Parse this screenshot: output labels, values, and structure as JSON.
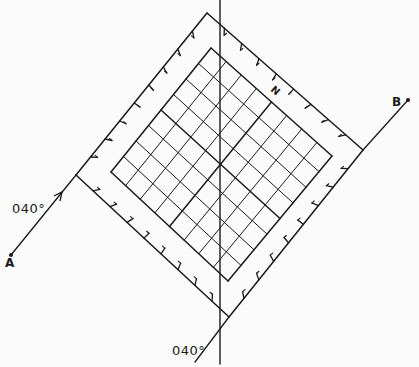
{
  "diagram": {
    "type": "grid-square-plan",
    "labels": {
      "point_a": "A",
      "point_b": "B",
      "bearing_left": "040°",
      "bearing_bottom": "040°",
      "north": "N"
    },
    "grid": {
      "cells_per_side": 8
    },
    "outer_square": {
      "top": [
        207,
        13
      ],
      "right": [
        363,
        150
      ],
      "bottom": [
        229,
        317
      ],
      "left": [
        76,
        175
      ]
    },
    "inner_square": {
      "top": [
        211,
        48
      ],
      "right": [
        332,
        156
      ],
      "bottom": [
        228,
        281
      ],
      "left": [
        111,
        172
      ]
    },
    "colors": {
      "line": "#1a1a1a",
      "background": "#fbfbfb"
    }
  }
}
